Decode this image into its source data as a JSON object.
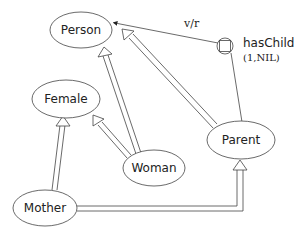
{
  "diagram": {
    "type": "KL-ONE concept taxonomy",
    "concepts": [
      {
        "id": "person",
        "label": "Person"
      },
      {
        "id": "female",
        "label": "Female"
      },
      {
        "id": "woman",
        "label": "Woman"
      },
      {
        "id": "parent",
        "label": "Parent"
      },
      {
        "id": "mother",
        "label": "Mother"
      }
    ],
    "role": {
      "label": "hasChild",
      "restriction": "(1,NIL)",
      "value_restriction_label": "v/r"
    },
    "subsumption_links": [
      {
        "from": "Woman",
        "to": "Person"
      },
      {
        "from": "Woman",
        "to": "Female"
      },
      {
        "from": "Parent",
        "to": "Person"
      },
      {
        "from": "Mother",
        "to": "Female"
      },
      {
        "from": "Mother",
        "to": "Parent"
      }
    ],
    "role_links": [
      {
        "from": "Parent",
        "to": "hasChild"
      },
      {
        "from": "hasChild",
        "to": "Person",
        "label": "v/r"
      }
    ]
  }
}
